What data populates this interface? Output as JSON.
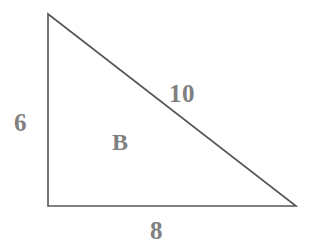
{
  "figure": {
    "background_color": "#ffffff",
    "stroke_color": "#555555",
    "label_color": "#808080",
    "width": 313,
    "height": 247
  },
  "labels": {
    "vertical_leg": "6",
    "horizontal_leg": "8",
    "hypotenuse": "10",
    "region": "B"
  },
  "chart_data": {
    "type": "diagram",
    "shape": "right-triangle",
    "title": "",
    "vertices": [
      {
        "name": "apex",
        "x": 48,
        "y": 14
      },
      {
        "name": "right-angle-corner",
        "x": 48,
        "y": 206
      },
      {
        "name": "base-right",
        "x": 296,
        "y": 206
      }
    ],
    "sides": [
      {
        "name": "vertical-leg",
        "label": "6",
        "length": 6,
        "from": "apex",
        "to": "right-angle-corner"
      },
      {
        "name": "horizontal-leg",
        "label": "8",
        "length": 8,
        "from": "right-angle-corner",
        "to": "base-right"
      },
      {
        "name": "hypotenuse",
        "label": "10",
        "length": 10,
        "from": "apex",
        "to": "base-right"
      }
    ],
    "region_label": "B",
    "units": "",
    "grid": false,
    "legend": "none"
  }
}
